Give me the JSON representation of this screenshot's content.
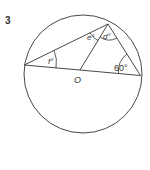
{
  "question": {
    "number": "3"
  },
  "diagram": {
    "center_label": "O",
    "angles": {
      "f": "f°",
      "e": "e°",
      "d": "d°",
      "given": "60°"
    },
    "colors": {
      "stroke": "#333333",
      "background": "#ffffff"
    }
  }
}
